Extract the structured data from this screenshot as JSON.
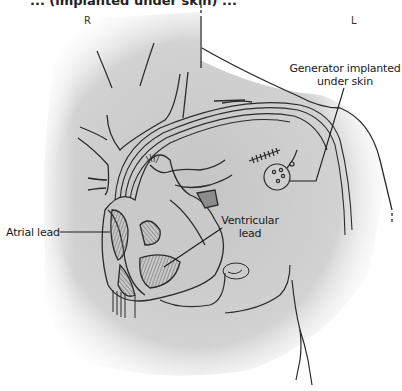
{
  "figure": {
    "title_partial": "... (implanted under skin) ...",
    "orientation": {
      "right_label": "R",
      "left_label": "L"
    },
    "labels": {
      "generator": [
        "Generator implanted",
        "under skin"
      ],
      "atrial_lead": "Atrial lead",
      "ventricular_lead": [
        "Ventricular",
        "lead"
      ]
    },
    "colors": {
      "line": "#2b2b2b",
      "shading": "#bdbdbd",
      "hatch": "#6b6b6b",
      "background": "#ffffff"
    }
  }
}
